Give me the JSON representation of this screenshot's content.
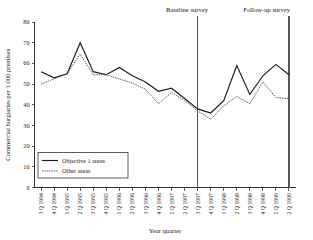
{
  "chart_data": {
    "type": "line",
    "title": "",
    "xlabel": "Year quarter",
    "ylabel": "Commercial burglaries per 1 000 premises",
    "ylim": [
      0,
      80
    ],
    "yticks": [
      0,
      10,
      20,
      30,
      40,
      50,
      60,
      70,
      80
    ],
    "grid": false,
    "legend_position": "lower-left",
    "categories": [
      "3 Q 1994",
      "4 Q 1994",
      "1 Q 1995",
      "2 Q 1995",
      "3 Q 1995",
      "4 Q 1995",
      "1 Q 1996",
      "2 Q 1996",
      "3 Q 1996",
      "4 Q 1996",
      "1 Q 1997",
      "2 Q 1997",
      "3 Q 1997",
      "4 Q 1997",
      "1 Q 1998",
      "2 Q 1998",
      "3 Q 1998",
      "4 Q 1998",
      "1 Q 1999",
      "2 Q 1999"
    ],
    "series": [
      {
        "name": "Objective 1 areas",
        "style": "solid",
        "color": "#1a1a1a",
        "values": [
          56,
          53,
          55,
          70,
          56,
          54.5,
          58,
          54,
          51,
          46.5,
          48,
          43,
          38,
          36,
          42,
          59,
          45,
          54,
          59.5,
          54.5
        ]
      },
      {
        "name": "Other areas",
        "style": "dotted",
        "color": "#4d4d4d",
        "values": [
          50,
          52.5,
          55,
          64.5,
          54.5,
          54.5,
          52.5,
          50.5,
          47.5,
          40.5,
          46,
          42,
          37,
          33,
          39.5,
          44,
          40.5,
          51,
          43.5,
          43
        ]
      }
    ],
    "annotations": [
      {
        "label": "Baseline survey",
        "at_category": "3 Q 1997"
      },
      {
        "label": "Follow-up survey",
        "at_category": "2 Q 1999"
      }
    ],
    "legend_entries": [
      "Objective 1 areas",
      "Other areas"
    ]
  },
  "legend": {
    "entry_1": "Objective 1 areas",
    "entry_2": "Other areas"
  },
  "axes": {
    "ylabel": "Commercial burglaries per 1 000 premises",
    "xlabel": "Year quarter",
    "ytick_0": "0",
    "ytick_10": "10",
    "ytick_20": "20",
    "ytick_30": "30",
    "ytick_40": "40",
    "ytick_50": "50",
    "ytick_60": "60",
    "ytick_70": "70",
    "ytick_80": "80"
  },
  "annotations": {
    "baseline": "Baseline survey",
    "followup": "Follow-up survey"
  }
}
